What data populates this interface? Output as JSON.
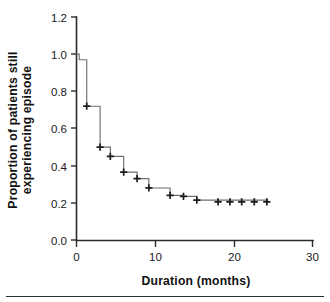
{
  "figure": {
    "background_color": "#ffffff",
    "line_color": "#6f6f6f",
    "axis_color": "#2b2b2b",
    "censor_color": "#1d1d1d"
  },
  "axes": {
    "x_title": "Duration (months)",
    "y_title_line1": "Proportion of patients still",
    "y_title_line2": "experiencing episode",
    "x_ticks": [
      "0",
      "10",
      "20",
      "30"
    ],
    "y_ticks": [
      "1.2",
      "1.0",
      "0.8",
      "0.6",
      "0.4",
      "0.2",
      "0.0"
    ]
  },
  "chart_data": {
    "type": "line",
    "title": "",
    "subtitle": "",
    "xlabel": "Duration (months)",
    "ylabel": "Proportion of patients still experiencing episode",
    "xlim": [
      0,
      30
    ],
    "ylim": [
      0.0,
      1.2
    ],
    "x_ticks": [
      0,
      10,
      20,
      30
    ],
    "y_ticks": [
      0.0,
      0.2,
      0.4,
      0.6,
      0.8,
      1.0,
      1.2
    ],
    "grid": false,
    "legend": null,
    "curve_style": "kaplan-meier step function",
    "series": [
      {
        "name": "Proportion still experiencing episode",
        "steps": [
          {
            "x": 0.0,
            "y": 1.0
          },
          {
            "x": 0.35,
            "y": 0.97
          },
          {
            "x": 1.3,
            "y": 0.72
          },
          {
            "x": 3.0,
            "y": 0.5
          },
          {
            "x": 4.3,
            "y": 0.45
          },
          {
            "x": 6.0,
            "y": 0.365
          },
          {
            "x": 7.7,
            "y": 0.33
          },
          {
            "x": 9.2,
            "y": 0.28
          },
          {
            "x": 11.9,
            "y": 0.24
          },
          {
            "x": 13.6,
            "y": 0.235
          },
          {
            "x": 15.3,
            "y": 0.215
          },
          {
            "x": 24.3,
            "y": 0.205
          }
        ],
        "censored_points": [
          {
            "x": 1.3,
            "y": 0.72
          },
          {
            "x": 3.0,
            "y": 0.5
          },
          {
            "x": 4.3,
            "y": 0.45
          },
          {
            "x": 6.0,
            "y": 0.365
          },
          {
            "x": 7.7,
            "y": 0.33
          },
          {
            "x": 9.2,
            "y": 0.28
          },
          {
            "x": 11.9,
            "y": 0.24
          },
          {
            "x": 13.6,
            "y": 0.235
          },
          {
            "x": 15.3,
            "y": 0.215
          },
          {
            "x": 18.0,
            "y": 0.205
          },
          {
            "x": 19.5,
            "y": 0.205
          },
          {
            "x": 21.0,
            "y": 0.205
          },
          {
            "x": 22.6,
            "y": 0.205
          },
          {
            "x": 24.2,
            "y": 0.205
          }
        ]
      }
    ]
  }
}
